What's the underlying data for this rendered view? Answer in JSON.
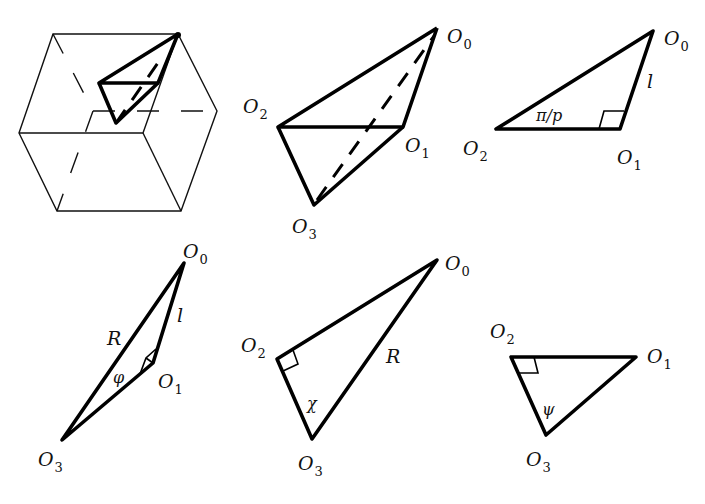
{
  "figure": {
    "panels": [
      {
        "id": "cube",
        "description": "cube with inscribed orthoscheme (O0-O1-O2-O3)"
      },
      {
        "id": "orthoscheme",
        "vertices": {
          "O0": "O_0",
          "O1": "O_1",
          "O2": "O_2",
          "O3": "O_3"
        }
      },
      {
        "id": "face-012",
        "vertices": {
          "O0": "O_0",
          "O1": "O_1",
          "O2": "O_2"
        },
        "edge_label": "l",
        "angle_label": "π/p",
        "right_angle_at": "O1"
      },
      {
        "id": "face-013",
        "vertices": {
          "O0": "O_0",
          "O1": "O_1",
          "O3": "O_3"
        },
        "edge_labels": [
          "R",
          "l"
        ],
        "angle_label": "φ",
        "right_angle_at": "O1"
      },
      {
        "id": "face-023",
        "vertices": {
          "O0": "O_0",
          "O2": "O_2",
          "O3": "O_3"
        },
        "edge_label": "R",
        "angle_label": "χ",
        "right_angle_at": "O2"
      },
      {
        "id": "face-123",
        "vertices": {
          "O1": "O_1",
          "O2": "O_2",
          "O3": "O_3"
        },
        "angle_label": "ψ",
        "right_angle_at": "O2"
      }
    ],
    "labels": {
      "O": "O",
      "s0": "0",
      "s1": "1",
      "s2": "2",
      "s3": "3",
      "l": "l",
      "R": "R",
      "pi_p": "π/p",
      "phi": "φ",
      "chi": "χ",
      "psi": "ψ"
    }
  }
}
